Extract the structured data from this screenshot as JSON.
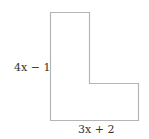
{
  "figure": {
    "shape": "L-shape",
    "stroke_color": "#b5b5b5",
    "labels": {
      "left_side": "4x − 1",
      "bottom_side": "3x + 2"
    }
  }
}
